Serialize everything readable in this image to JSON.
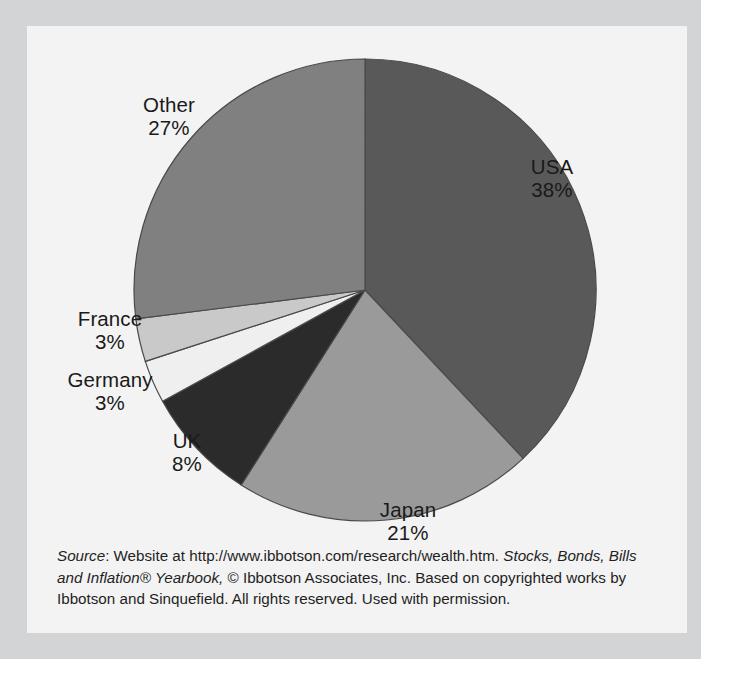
{
  "chart_data": {
    "type": "pie",
    "title": "",
    "subtitle": "",
    "xlabel": "",
    "ylabel": "",
    "legend_position": "none",
    "labels_position": "outside-callout",
    "start_angle_deg": 0,
    "direction": "clockwise",
    "unit": "%",
    "categories": [
      "USA",
      "Japan",
      "UK",
      "Germany",
      "France",
      "Other"
    ],
    "values": [
      38,
      21,
      8,
      3,
      3,
      27
    ],
    "total": 100,
    "slices": [
      {
        "label": "USA",
        "value": 38,
        "value_text": "38%",
        "color": "#595959"
      },
      {
        "label": "Japan",
        "value": 21,
        "value_text": "21%",
        "color": "#9a9a9a"
      },
      {
        "label": "UK",
        "value": 8,
        "value_text": "8%",
        "color": "#2b2b2b"
      },
      {
        "label": "Germany",
        "value": 3,
        "value_text": "3%",
        "color": "#efefef"
      },
      {
        "label": "France",
        "value": 3,
        "value_text": "3%",
        "color": "#c9c9c9"
      },
      {
        "label": "Other",
        "value": 27,
        "value_text": "27%",
        "color": "#808080"
      }
    ]
  },
  "labels": {
    "usa": {
      "name": "USA",
      "pct": "38%"
    },
    "japan": {
      "name": "Japan",
      "pct": "21%"
    },
    "uk": {
      "name": "UK",
      "pct": "8%"
    },
    "germany": {
      "name": "Germany",
      "pct": "3%"
    },
    "france": {
      "name": "France",
      "pct": "3%"
    },
    "other": {
      "name": "Other",
      "pct": "27%"
    }
  },
  "source_note": {
    "source_word": "Source",
    "part1": ": Website at http://www.ibbotson.com/research/wealth.htm. ",
    "italic1": "Stocks, Bonds, Bills and Inflation® Yearbook,",
    "part2": " © Ibbotson Associates, Inc. Based on copyrighted works by Ibbotson and Sinquefield. All rights reserved. Used with permission."
  },
  "colors": {
    "page_background": "#ffffff",
    "outer_frame": "#d3d4d6",
    "chart_panel": "#f3f3f3",
    "slice_outline": "#4a4a4a",
    "text": "#1a1a1a"
  }
}
